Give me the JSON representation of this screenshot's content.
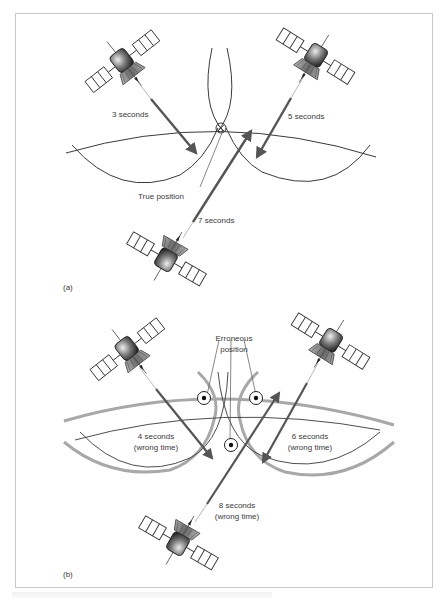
{
  "figure": {
    "colors": {
      "line": "#3a3a3a",
      "arrow": "#555555",
      "thick_gray": "#a8a8a8",
      "frame": "#c8c8c8",
      "text": "#3a3a3a"
    },
    "panel_a": {
      "label": "(a)",
      "labels": {
        "sat1_time": "3 seconds",
        "sat2_time": "5 seconds",
        "sat3_time": "7 seconds",
        "intersection": "True position"
      }
    },
    "panel_b": {
      "label": "(b)",
      "labels": {
        "sat1_time_line1": "4 seconds",
        "sat1_time_line2": "(wrong time)",
        "sat2_time_line1": "6 seconds",
        "sat2_time_line2": "(wrong time)",
        "sat3_time_line1": "8 seconds",
        "sat3_time_line2": "(wrong time)",
        "intersection_line1": "Erroneous",
        "intersection_line2": "position"
      }
    },
    "icons": {
      "satellite": "satellite-icon",
      "position_marker": "crosshair-circle-icon",
      "erroneous_marker": "dot-circle-icon"
    }
  }
}
